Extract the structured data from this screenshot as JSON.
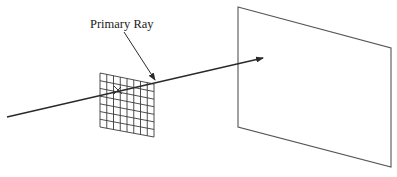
{
  "diagram": {
    "label": "Primary Ray",
    "colors": {
      "ink": "#2a2a2a",
      "grid": "#3a3a3a",
      "screen": "#555555",
      "background": "#ffffff"
    },
    "components": {
      "ray": {
        "from": [
          7,
          117
        ],
        "to": [
          263,
          58
        ]
      },
      "leader": {
        "from": [
          124,
          32
        ],
        "to": [
          155,
          80
        ]
      },
      "pixel_grid": {
        "corners": [
          [
            100,
            73
          ],
          [
            154,
            84
          ],
          [
            154,
            137
          ],
          [
            100,
            127
          ]
        ],
        "columns": 8,
        "rows": 7
      },
      "screen": {
        "corners": [
          [
            238,
            7
          ],
          [
            391,
            48
          ],
          [
            391,
            167
          ],
          [
            238,
            127
          ]
        ]
      }
    }
  }
}
